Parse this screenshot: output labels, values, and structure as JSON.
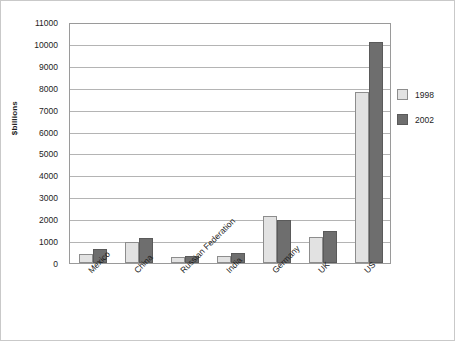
{
  "chart_data": {
    "type": "bar",
    "title": "",
    "subtitle": "",
    "xlabel": "",
    "ylabel": "$billions",
    "ylim": [
      0,
      11000
    ],
    "ytick_step": 1000,
    "yticks": [
      11000,
      10000,
      9000,
      8000,
      7000,
      6000,
      5000,
      4000,
      3000,
      2000,
      1000,
      0
    ],
    "ytick_labels": [
      "11000",
      "10000",
      "9000",
      "8000",
      "7000",
      "6000",
      "5000",
      "4000",
      "3000",
      "2000",
      "1000",
      "0"
    ],
    "grid": true,
    "grid_axis": "y",
    "legend_position": "right",
    "categories": [
      "Mexico",
      "China",
      "Russian Federation",
      "India",
      "Germany",
      "UK",
      "US"
    ],
    "series": [
      {
        "name": "1998",
        "color": "#e2e2e2",
        "border_color": "#8d8d8d",
        "values": [
          430,
          950,
          280,
          340,
          2150,
          1200,
          7800
        ]
      },
      {
        "name": "2002",
        "color": "#6e6e6e",
        "border_color": "#5a5a5a",
        "values": [
          620,
          1150,
          320,
          460,
          1950,
          1450,
          10100
        ]
      }
    ]
  },
  "legend": {
    "items": [
      {
        "label": "1998"
      },
      {
        "label": "2002"
      }
    ]
  }
}
